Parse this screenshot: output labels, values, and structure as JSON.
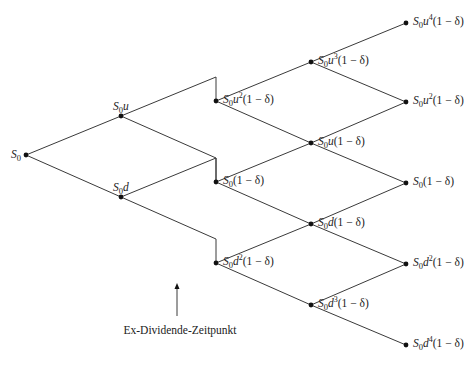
{
  "diagram": {
    "colors": {
      "line": "#3a3a3a",
      "node": "#111111",
      "text": "#222222",
      "background": "#ffffff"
    },
    "nodes": [
      {
        "id": "n0",
        "x": 26,
        "y": 155,
        "label": "S0",
        "label_pos": "left"
      },
      {
        "id": "u1",
        "x": 121,
        "y": 116,
        "label": "S0u",
        "label_pos": "above"
      },
      {
        "id": "d1",
        "x": 121,
        "y": 197,
        "label": "S0d",
        "label_pos": "above"
      },
      {
        "id": "uu2",
        "x": 216,
        "y": 101,
        "label": "S0u^2(1 − δ)",
        "label_pos": "right"
      },
      {
        "id": "ud2",
        "x": 216,
        "y": 182,
        "label": "S0(1 − δ)",
        "label_pos": "right"
      },
      {
        "id": "dd2",
        "x": 216,
        "y": 263,
        "label": "S0d^2(1 − δ)",
        "label_pos": "right"
      },
      {
        "id": "u3",
        "x": 311,
        "y": 62,
        "label": "S0u^3(1 − δ)",
        "label_pos": "right"
      },
      {
        "id": "u1d",
        "x": 311,
        "y": 143,
        "label": "S0u(1 − δ)",
        "label_pos": "right"
      },
      {
        "id": "d1u",
        "x": 311,
        "y": 224,
        "label": "S0d(1 − δ)",
        "label_pos": "right"
      },
      {
        "id": "d3",
        "x": 311,
        "y": 305,
        "label": "S0d^3(1 − δ)",
        "label_pos": "right"
      },
      {
        "id": "u4",
        "x": 406,
        "y": 23,
        "label": "S0u^4(1 − δ)",
        "label_pos": "right"
      },
      {
        "id": "u2e",
        "x": 406,
        "y": 102,
        "label": "S0u^2(1 − δ)",
        "label_pos": "right"
      },
      {
        "id": "m0",
        "x": 406,
        "y": 183,
        "label": "S0(1 − δ)",
        "label_pos": "right"
      },
      {
        "id": "d2e",
        "x": 406,
        "y": 264,
        "label": "S0d^2(1 − δ)",
        "label_pos": "right"
      },
      {
        "id": "d4",
        "x": 406,
        "y": 345,
        "label": "S0d^4(1 − δ)",
        "label_pos": "right"
      }
    ],
    "edges": [
      {
        "from": "n0",
        "to": "u1"
      },
      {
        "from": "n0",
        "to": "d1"
      },
      {
        "from": "u1",
        "to": "uu2",
        "kink": [
          216,
          77
        ]
      },
      {
        "from": "u1",
        "to": "ud2",
        "kink": [
          216,
          158
        ]
      },
      {
        "from": "d1",
        "to": "ud2",
        "kink": [
          216,
          158
        ]
      },
      {
        "from": "d1",
        "to": "dd2",
        "kink": [
          216,
          239
        ]
      },
      {
        "from": "uu2",
        "to": "u3"
      },
      {
        "from": "uu2",
        "to": "u1d"
      },
      {
        "from": "ud2",
        "to": "u1d"
      },
      {
        "from": "ud2",
        "to": "d1u"
      },
      {
        "from": "dd2",
        "to": "d1u"
      },
      {
        "from": "dd2",
        "to": "d3"
      },
      {
        "from": "u3",
        "to": "u4"
      },
      {
        "from": "u3",
        "to": "u2e"
      },
      {
        "from": "u1d",
        "to": "u2e"
      },
      {
        "from": "u1d",
        "to": "m0"
      },
      {
        "from": "d1u",
        "to": "m0"
      },
      {
        "from": "d1u",
        "to": "d2e"
      },
      {
        "from": "d3",
        "to": "d2e"
      },
      {
        "from": "d3",
        "to": "d4"
      }
    ],
    "annotation": {
      "text": "Ex-Dividende-Zeitpunkt",
      "arrow": {
        "x": 177,
        "y_start": 316,
        "y_end": 283
      },
      "text_x": 180,
      "text_y": 334
    }
  }
}
